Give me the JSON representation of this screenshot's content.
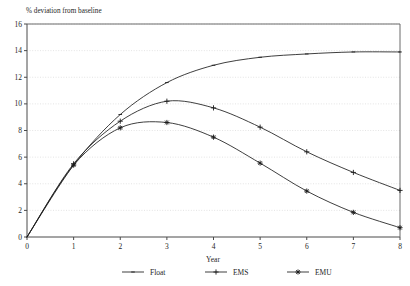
{
  "chart_data": {
    "type": "line",
    "title": "",
    "ylabel_inline": "% deviation from baseline",
    "xlabel": "Year",
    "ylabel": "",
    "x": [
      0,
      1,
      2,
      3,
      4,
      5,
      6,
      7,
      8
    ],
    "xlim": [
      0,
      8
    ],
    "ylim": [
      0,
      16
    ],
    "xticks": [
      "0",
      "1",
      "2",
      "3",
      "4",
      "5",
      "6",
      "7",
      "8"
    ],
    "yticks": [
      "0",
      "2",
      "4",
      "6",
      "8",
      "10",
      "12",
      "14",
      "16"
    ],
    "grid": true,
    "legend_position": "bottom",
    "series": [
      {
        "name": "Float",
        "marker": "dash",
        "values": [
          0,
          5.4,
          9.2,
          11.6,
          12.9,
          13.5,
          13.75,
          13.9,
          13.9
        ]
      },
      {
        "name": "EMS",
        "marker": "plus",
        "values": [
          0,
          5.5,
          8.7,
          10.2,
          9.7,
          8.25,
          6.4,
          4.85,
          3.5
        ]
      },
      {
        "name": "EMU",
        "marker": "asterisk",
        "values": [
          0,
          5.4,
          8.2,
          8.6,
          7.5,
          5.55,
          3.45,
          1.85,
          0.7
        ]
      }
    ]
  },
  "legend": {
    "items": [
      {
        "label": "Float"
      },
      {
        "label": "EMS"
      },
      {
        "label": "EMU"
      }
    ]
  },
  "axis": {
    "x_title": "Year",
    "y_inline_title": "% deviation from baseline"
  }
}
